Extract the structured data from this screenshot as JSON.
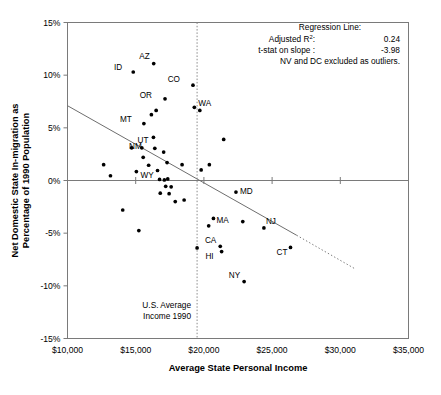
{
  "chart_data": {
    "type": "scatter",
    "title": "",
    "xlabel": "Average State Personal Income",
    "ylabel": "Net Domestic State In-migration as Percentage of 1990 Population",
    "xlim": [
      10000,
      35000
    ],
    "ylim": [
      -15,
      15
    ],
    "grid": false,
    "legend": "none",
    "xticks": [
      "$10,000",
      "$15,000",
      "$20,000",
      "$25,000",
      "$30,000",
      "$35,000"
    ],
    "xtick_values": [
      10000,
      15000,
      20000,
      25000,
      30000,
      35000
    ],
    "yticks": [
      "15%",
      "10%",
      "5%",
      "0%",
      "-5%",
      "-10%",
      "-15%"
    ],
    "ytick_values": [
      15,
      10,
      5,
      0,
      -5,
      -10,
      -15
    ],
    "annotations": {
      "us_average_line_label": [
        "U.S. Average",
        "Income 1990"
      ],
      "us_average_income": 19500,
      "regression": {
        "heading": "Regression Line:",
        "r2_label": "Adjusted R",
        "r2_sup": "2",
        "r2_colon": ":",
        "r2_value": "0.24",
        "tstat_label": "t-stat on slope :",
        "tstat_value": "-3.98",
        "excluded_note": "NV and DC excluded as outliers."
      },
      "regression_line": {
        "x_start": 10000,
        "y_start": 7.1,
        "x_solid_end": 26800,
        "y_solid_end": -5.2,
        "x_dotted_end": 31100,
        "y_dotted_end": -8.4
      }
    },
    "points": [
      {
        "label": "",
        "x": 12650,
        "y": 1.5
      },
      {
        "label": "",
        "x": 13150,
        "y": 0.45
      },
      {
        "label": "",
        "x": 14050,
        "y": -2.8
      },
      {
        "label": "",
        "x": 14700,
        "y": 3.1
      },
      {
        "label": "",
        "x": 14820,
        "y": 10.3
      },
      {
        "label": "ID",
        "x": 14820,
        "y": 10.3
      },
      {
        "label": "",
        "x": 15050,
        "y": 0.85
      },
      {
        "label": "",
        "x": 15230,
        "y": -4.75
      },
      {
        "label": "",
        "x": 15450,
        "y": 3.1
      },
      {
        "label": "",
        "x": 15550,
        "y": 2.2
      },
      {
        "label": "",
        "x": 15600,
        "y": 5.4
      },
      {
        "label": "MT",
        "x": 15600,
        "y": 5.4
      },
      {
        "label": "",
        "x": 15950,
        "y": 1.45
      },
      {
        "label": "",
        "x": 16150,
        "y": 6.25
      },
      {
        "label": "",
        "x": 16300,
        "y": 4.1
      },
      {
        "label": "UT",
        "x": 16300,
        "y": 4.1
      },
      {
        "label": "",
        "x": 16320,
        "y": 11.1
      },
      {
        "label": "AZ",
        "x": 16320,
        "y": 11.1
      },
      {
        "label": "",
        "x": 16400,
        "y": 3.05
      },
      {
        "label": "NM",
        "x": 16400,
        "y": 3.05
      },
      {
        "label": "",
        "x": 16500,
        "y": 6.65
      },
      {
        "label": "",
        "x": 16600,
        "y": 0.95
      },
      {
        "label": "",
        "x": 16750,
        "y": 0.1
      },
      {
        "label": "",
        "x": 16800,
        "y": -1.2
      },
      {
        "label": "",
        "x": 17050,
        "y": 2.7
      },
      {
        "label": "",
        "x": 17100,
        "y": 0.05
      },
      {
        "label": "",
        "x": 17150,
        "y": 7.75
      },
      {
        "label": "OR",
        "x": 17150,
        "y": 7.75
      },
      {
        "label": "",
        "x": 17200,
        "y": -0.55
      },
      {
        "label": "",
        "x": 17300,
        "y": 1.7
      },
      {
        "label": "",
        "x": 17350,
        "y": 0.15
      },
      {
        "label": "WY",
        "x": 17350,
        "y": 0.15
      },
      {
        "label": "",
        "x": 17450,
        "y": -1.25
      },
      {
        "label": "",
        "x": 17600,
        "y": -0.6
      },
      {
        "label": "",
        "x": 17900,
        "y": -2.0
      },
      {
        "label": "",
        "x": 18400,
        "y": 1.5
      },
      {
        "label": "",
        "x": 18550,
        "y": -1.85
      },
      {
        "label": "",
        "x": 19200,
        "y": 9.05
      },
      {
        "label": "CO",
        "x": 19200,
        "y": 9.05
      },
      {
        "label": "",
        "x": 19300,
        "y": 6.95
      },
      {
        "label": "WA",
        "x": 19300,
        "y": 6.95
      },
      {
        "label": "",
        "x": 19500,
        "y": -6.4
      },
      {
        "label": "",
        "x": 19700,
        "y": 6.65
      },
      {
        "label": "",
        "x": 19800,
        "y": 1.0
      },
      {
        "label": "",
        "x": 20350,
        "y": -4.3
      },
      {
        "label": "",
        "x": 20400,
        "y": 1.5
      },
      {
        "label": "",
        "x": 20700,
        "y": -3.6
      },
      {
        "label": "",
        "x": 21200,
        "y": -6.25
      },
      {
        "label": "CA",
        "x": 21200,
        "y": -6.25
      },
      {
        "label": "",
        "x": 21300,
        "y": -6.75
      },
      {
        "label": "HI",
        "x": 21300,
        "y": -6.75
      },
      {
        "label": "",
        "x": 21450,
        "y": 3.9
      },
      {
        "label": "",
        "x": 22350,
        "y": -1.1
      },
      {
        "label": "MD",
        "x": 22350,
        "y": -1.1
      },
      {
        "label": "",
        "x": 22850,
        "y": -3.9
      },
      {
        "label": "MA",
        "x": 22850,
        "y": -3.9
      },
      {
        "label": "",
        "x": 22950,
        "y": -9.6
      },
      {
        "label": "NY",
        "x": 22950,
        "y": -9.6
      },
      {
        "label": "",
        "x": 24400,
        "y": -4.5
      },
      {
        "label": "NJ",
        "x": 24400,
        "y": -4.5
      },
      {
        "label": "",
        "x": 26350,
        "y": -6.35
      },
      {
        "label": "CT",
        "x": 26350,
        "y": -6.35
      }
    ],
    "labeled_points": [
      {
        "label": "ID",
        "x": 14820,
        "y": 10.3,
        "dx": -11,
        "dy": -2
      },
      {
        "label": "AZ",
        "x": 16320,
        "y": 11.1,
        "dx": -4,
        "dy": -5
      },
      {
        "label": "MT",
        "x": 15600,
        "y": 5.4,
        "dx": -12,
        "dy": -2
      },
      {
        "label": "UT",
        "x": 16300,
        "y": 4.1,
        "dx": -5,
        "dy": 6
      },
      {
        "label": "NM",
        "x": 16400,
        "y": 3.05,
        "dx": -13,
        "dy": 1
      },
      {
        "label": "OR",
        "x": 17150,
        "y": 7.75,
        "dx": -13,
        "dy": -1
      },
      {
        "label": "WY",
        "x": 17350,
        "y": 0.15,
        "dx": -14,
        "dy": -1
      },
      {
        "label": "CO",
        "x": 19200,
        "y": 9.05,
        "dx": -13,
        "dy": -3
      },
      {
        "label": "WA",
        "x": 19300,
        "y": 6.95,
        "dx": 4,
        "dy": -1
      },
      {
        "label": "MD",
        "x": 22350,
        "y": -1.1,
        "dx": 4,
        "dy": 2
      },
      {
        "label": "MA",
        "x": 22850,
        "y": -3.9,
        "dx": -14,
        "dy": 1
      },
      {
        "label": "NJ",
        "x": 24400,
        "y": -4.5,
        "dx": 2,
        "dy": -4
      },
      {
        "label": "CA",
        "x": 21200,
        "y": -6.25,
        "dx": -4,
        "dy": -3
      },
      {
        "label": "HI",
        "x": 21300,
        "y": -6.75,
        "dx": -8,
        "dy": 7
      },
      {
        "label": "NY",
        "x": 22950,
        "y": -9.6,
        "dx": -4,
        "dy": -4
      },
      {
        "label": "CT",
        "x": 26350,
        "y": -6.35,
        "dx": -3,
        "dy": 8
      }
    ]
  }
}
